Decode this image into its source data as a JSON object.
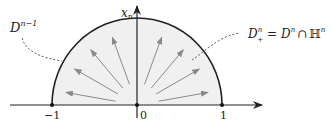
{
  "labels": {
    "boundary": "D",
    "boundary_sup": "n−1",
    "halfdisk_lhs": "D",
    "halfdisk_sup": "n",
    "halfdisk_sub": "+",
    "halfdisk_eq": "=",
    "halfdisk_rhs_D": "D",
    "halfdisk_rhs_sup": "n",
    "halfdisk_cap": "∩",
    "halfdisk_H": "ℍ",
    "halfdisk_H_sup": "n",
    "axis_var": "x",
    "axis_var_sub": "n",
    "tick_neg1": "−1",
    "tick_0": "0",
    "tick_1": "1"
  },
  "arrows_angles_deg": [
    10,
    30,
    50,
    70,
    110,
    130,
    150,
    170
  ],
  "colors": {
    "fill": "#f0f0f0",
    "arrow": "#8a8a8a",
    "boundary": "#222222",
    "axis": "#222222"
  }
}
